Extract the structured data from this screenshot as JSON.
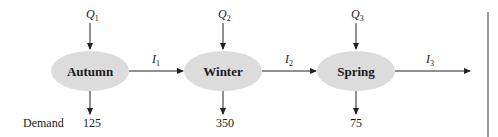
{
  "diagram": {
    "type": "flow-network",
    "colors": {
      "node_fill": "#dcdcdc",
      "line": "#222222",
      "side_bar": "#9a9a9a"
    },
    "nodes": [
      {
        "label": "Autumn",
        "supply_var": "Q",
        "supply_sub": "1",
        "demand": "125"
      },
      {
        "label": "Winter",
        "supply_var": "Q",
        "supply_sub": "2",
        "demand": "350"
      },
      {
        "label": "Spring",
        "supply_var": "Q",
        "supply_sub": "3",
        "demand": "75"
      }
    ],
    "inventory_arcs": [
      {
        "var": "I",
        "sub": "1"
      },
      {
        "var": "I",
        "sub": "2"
      },
      {
        "var": "I",
        "sub": "3"
      }
    ],
    "demand_row_label": "Demand"
  }
}
